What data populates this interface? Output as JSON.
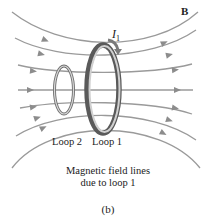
{
  "figure": {
    "field_label": "B",
    "current_label": "I",
    "current_subscript": "1",
    "loop_labels": [
      "Loop 2",
      "Loop 1"
    ],
    "caption_lines": [
      "Magnetic field lines",
      "due to loop 1"
    ],
    "panel_label": "(b)"
  },
  "colors": {
    "field_line": "#9a9a9a",
    "loop_outer": "#6e6e6e",
    "loop_inner": "#d8d8d8",
    "current_arrow": "#7a7a7a",
    "text": "#222222"
  }
}
